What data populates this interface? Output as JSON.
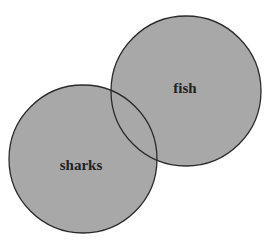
{
  "diagram": {
    "type": "venn",
    "sets": [
      {
        "label": "sharks",
        "cx": 83,
        "cy": 159,
        "r": 74
      },
      {
        "label": "fish",
        "cx": 186,
        "cy": 91,
        "r": 75
      }
    ],
    "colors": {
      "fill": "#a8a8a8",
      "stroke": "#2a2a2a",
      "background": "#ffffff"
    }
  }
}
